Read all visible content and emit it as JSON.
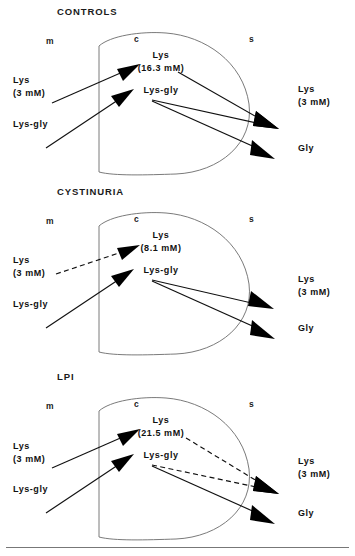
{
  "figure": {
    "type": "diagram",
    "compartments": {
      "mucosal": "m",
      "cell": "c",
      "serosal": "s"
    }
  },
  "panels": [
    {
      "id": "controls",
      "heading": "CONTROLS",
      "compartment_m": "m",
      "compartment_c": "c",
      "compartment_s": "s",
      "cell_lys_name": "Lys",
      "cell_lys_conc": "(16.3 mM)",
      "cell_dipeptide": "Lys-gly",
      "mucosal_lys_name": "Lys",
      "mucosal_lys_conc": "(3 mM)",
      "mucosal_dipeptide": "Lys-gly",
      "serosal_lys_name": "Lys",
      "serosal_lys_conc": "(3 mM)",
      "serosal_gly": "Gly",
      "lys_uptake_style": "solid",
      "dipeptide_uptake_style": "solid",
      "lys_efflux_style": "solid",
      "dipeptide_efflux_style": "solid",
      "gly_efflux_style": "solid"
    },
    {
      "id": "cystinuria",
      "heading": "CYSTINURIA",
      "compartment_m": "m",
      "compartment_c": "c",
      "compartment_s": "s",
      "cell_lys_name": "Lys",
      "cell_lys_conc": "(8.1 mM)",
      "cell_dipeptide": "Lys-gly",
      "mucosal_lys_name": "Lys",
      "mucosal_lys_conc": "(3 mM)",
      "mucosal_dipeptide": "Lys-gly",
      "serosal_lys_name": "Lys",
      "serosal_lys_conc": "(3 mM)",
      "serosal_gly": "Gly",
      "lys_uptake_style": "dashed",
      "dipeptide_uptake_style": "solid",
      "lys_efflux_style": "solid",
      "dipeptide_efflux_style": "solid",
      "gly_efflux_style": "solid"
    },
    {
      "id": "lpi",
      "heading": "LPI",
      "compartment_m": "m",
      "compartment_c": "c",
      "compartment_s": "s",
      "cell_lys_name": "Lys",
      "cell_lys_conc": "(21.5 mM)",
      "cell_dipeptide": "Lys-gly",
      "mucosal_lys_name": "Lys",
      "mucosal_lys_conc": "(3 mM)",
      "mucosal_dipeptide": "Lys-gly",
      "serosal_lys_name": "Lys",
      "serosal_lys_conc": "(3 mM)",
      "serosal_gly": "Gly",
      "lys_uptake_style": "solid",
      "dipeptide_uptake_style": "solid",
      "lys_efflux_style": "dashed",
      "dipeptide_efflux_style": "dashed",
      "gly_efflux_style": "solid"
    }
  ],
  "colors": {
    "ink": "#101010",
    "cell_outline": "#6b6b6b",
    "rule": "#777777"
  }
}
